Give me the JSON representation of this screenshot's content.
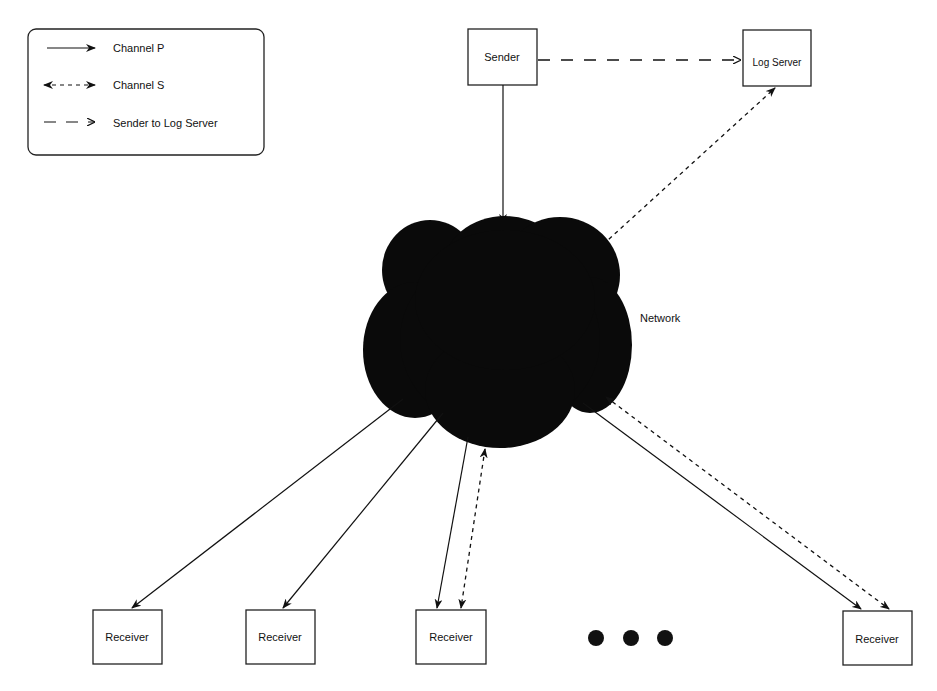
{
  "legend": {
    "items": [
      {
        "label": "Channel P",
        "style": "solid-arrow"
      },
      {
        "label": "Channel S",
        "style": "dotted-double-arrow"
      },
      {
        "label": "Sender to Log Server",
        "style": "dashed-arrow"
      }
    ]
  },
  "nodes": {
    "sender": "Sender",
    "log_server": "Log Server",
    "network": "Network",
    "receivers": [
      "Receiver",
      "Receiver",
      "Receiver",
      "Receiver"
    ]
  },
  "ellipsis": "• • •",
  "colors": {
    "ink": "#111111",
    "background": "#ffffff"
  }
}
